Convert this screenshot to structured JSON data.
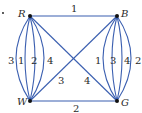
{
  "graph": {
    "vertices": [
      {
        "id": "R",
        "label": "R"
      },
      {
        "id": "B",
        "label": "B"
      },
      {
        "id": "W",
        "label": "W"
      },
      {
        "id": "G",
        "label": "G"
      }
    ],
    "edges": {
      "R_B": "1",
      "W_G": "2",
      "R_G": "4",
      "W_B": "3",
      "R_W": [
        "3",
        "1",
        "2",
        "4"
      ],
      "B_G": [
        "1",
        "3",
        "4",
        "2"
      ]
    },
    "edge_color": "#3b5fb0"
  }
}
